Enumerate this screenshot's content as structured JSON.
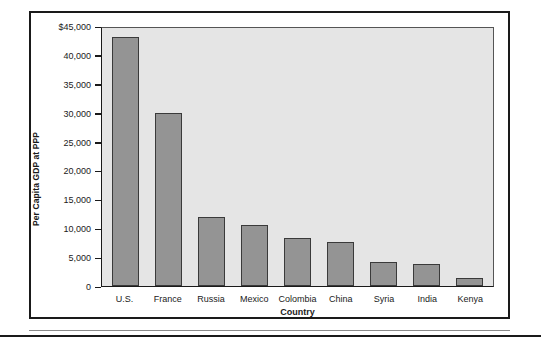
{
  "chart_data": {
    "type": "bar",
    "title": "",
    "xlabel": "Country",
    "ylabel": "Per Capita GDP at PPP",
    "categories": [
      "U.S.",
      "France",
      "Russia",
      "Mexico",
      "Colombia",
      "China",
      "Syria",
      "India",
      "Kenya"
    ],
    "values": [
      43500,
      30200,
      12100,
      10600,
      8400,
      7600,
      4200,
      3800,
      1400
    ],
    "ylim": [
      0,
      45000
    ],
    "yticks": [
      0,
      5000,
      10000,
      15000,
      20000,
      25000,
      30000,
      35000,
      40000,
      45000
    ],
    "ytick_labels": [
      "0",
      "5,000",
      "10,000",
      "15,000",
      "20,000",
      "25,000",
      "30,000",
      "35,000",
      "40,000",
      "$45,000"
    ],
    "grid": false,
    "legend": null,
    "colors": {
      "bar_fill": "#949494",
      "bar_edge": "#3a3a3a",
      "plot_background": "#e5e5e5",
      "axis": "#1a1a1a",
      "frame": "#1a1a1a",
      "page_background": "#ffffff"
    }
  }
}
